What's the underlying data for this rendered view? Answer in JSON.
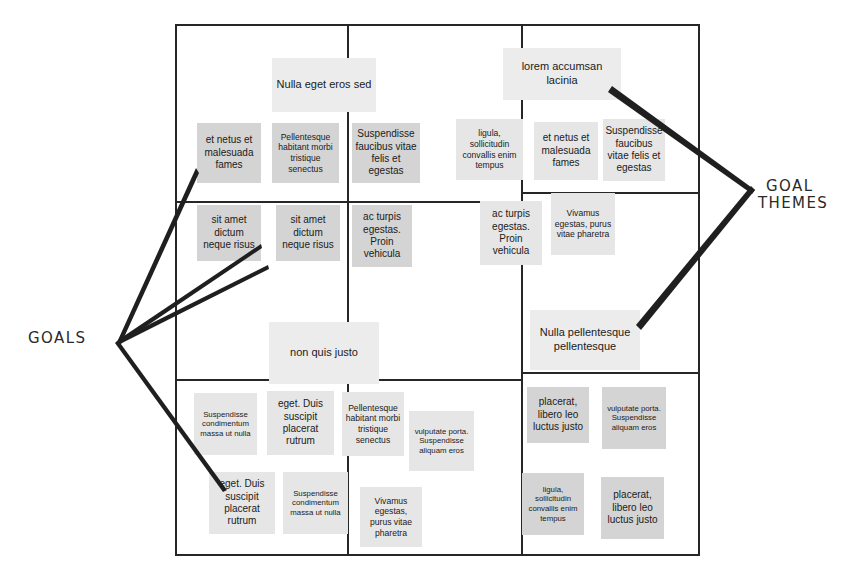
{
  "diagram": {
    "frame": {
      "x": 175,
      "y": 24,
      "width": 525,
      "height": 532
    },
    "colors": {
      "frame_line": "#262626",
      "header_note": "#ececec",
      "item_note_dark": "#d4d4d4",
      "item_note_light": "#e6e6e6",
      "text": "#1b1b1b",
      "annotation": "#2a2a2a"
    }
  },
  "annotations": [
    {
      "id": "goals",
      "label_line1": "GOALS",
      "label_line2": "",
      "x": 28,
      "y": 330
    },
    {
      "id": "goal-themes",
      "label_line1": "GOAL",
      "label_line2": "THEMES",
      "x": 766,
      "y": 178
    }
  ],
  "quadrants": {
    "top_left": {
      "header": {
        "text": "Nulla eget eros sed",
        "x": 272,
        "y": 58,
        "w": 104,
        "h": 54,
        "size": "fs-11"
      },
      "items": [
        {
          "text": "et netus et malesuada fames",
          "x": 197,
          "y": 123,
          "w": 64,
          "h": 60,
          "size": "fs-10",
          "tone": "item-dark"
        },
        {
          "text": "Pellentesque habitant morbi tristique senectus",
          "x": 272,
          "y": 123,
          "w": 67,
          "h": 60,
          "size": "fs-9",
          "tone": "item-dark"
        },
        {
          "text": "Suspendisse faucibus vitae felis et egestas",
          "x": 352,
          "y": 123,
          "w": 68,
          "h": 60,
          "size": "fs-10",
          "tone": "item-dark"
        },
        {
          "text": "sit amet dictum neque risus",
          "x": 197,
          "y": 205,
          "w": 64,
          "h": 56,
          "size": "fs-10",
          "tone": "item-dark"
        },
        {
          "text": "sit amet dictum neque risus",
          "x": 276,
          "y": 205,
          "w": 64,
          "h": 56,
          "size": "fs-10",
          "tone": "item-dark"
        },
        {
          "text": "ac turpis egestas. Proin vehicula",
          "x": 352,
          "y": 205,
          "w": 60,
          "h": 62,
          "size": "fs-10",
          "tone": "item-dark"
        }
      ]
    },
    "top_right": {
      "header": {
        "text": "lorem accumsan lacinia",
        "x": 503,
        "y": 48,
        "w": 118,
        "h": 52,
        "size": "fs-11"
      },
      "items": [
        {
          "text": "ligula, sollicitudin convallis enim tempus",
          "x": 456,
          "y": 119,
          "w": 67,
          "h": 61,
          "size": "fs-9",
          "tone": "item-light"
        },
        {
          "text": "et netus et malesuada fames",
          "x": 534,
          "y": 122,
          "w": 64,
          "h": 58,
          "size": "fs-10",
          "tone": "item-light"
        },
        {
          "text": "Suspendisse faucibus vitae felis et egestas",
          "x": 603,
          "y": 119,
          "w": 62,
          "h": 62,
          "size": "fs-10",
          "tone": "item-light"
        },
        {
          "text": "ac turpis egestas. Proin vehicula",
          "x": 480,
          "y": 201,
          "w": 62,
          "h": 64,
          "size": "fs-10",
          "tone": "item-light"
        },
        {
          "text": "Vivamus egestas, purus vitae pharetra",
          "x": 551,
          "y": 193,
          "w": 64,
          "h": 62,
          "size": "fs-9",
          "tone": "item-light"
        }
      ]
    },
    "bottom_left": {
      "header": {
        "text": "non quis justo",
        "x": 269,
        "y": 322,
        "w": 110,
        "h": 62,
        "size": "fs-11"
      },
      "items": [
        {
          "text": "Suspendisse condimentum massa ut nulla",
          "x": 194,
          "y": 393,
          "w": 63,
          "h": 62,
          "size": "fs-8",
          "tone": "item-light"
        },
        {
          "text": "eget. Duis suscipit placerat rutrum",
          "x": 267,
          "y": 391,
          "w": 67,
          "h": 64,
          "size": "fs-10",
          "tone": "item-light"
        },
        {
          "text": "Pellentesque habitant morbi tristique senectus",
          "x": 342,
          "y": 392,
          "w": 62,
          "h": 64,
          "size": "fs-9",
          "tone": "item-light"
        },
        {
          "text": "vulputate porta. Suspendisse aliquam eros",
          "x": 409,
          "y": 411,
          "w": 65,
          "h": 60,
          "size": "fs-8",
          "tone": "item-light"
        },
        {
          "text": "eget. Duis suscipit placerat rutrum",
          "x": 209,
          "y": 472,
          "w": 66,
          "h": 62,
          "size": "fs-10",
          "tone": "item-light"
        },
        {
          "text": "Suspendisse condimentum massa ut nulla",
          "x": 283,
          "y": 472,
          "w": 65,
          "h": 62,
          "size": "fs-8",
          "tone": "item-light"
        },
        {
          "text": "Vivamus egestas, purus vitae pharetra",
          "x": 360,
          "y": 487,
          "w": 62,
          "h": 60,
          "size": "fs-9",
          "tone": "item-light"
        }
      ]
    },
    "bottom_right": {
      "header": {
        "text": "Nulla pellentesque pellentesque",
        "x": 530,
        "y": 310,
        "w": 110,
        "h": 60,
        "size": "fs-11"
      },
      "items": [
        {
          "text": "placerat, libero leo luctus justo",
          "x": 527,
          "y": 387,
          "w": 62,
          "h": 56,
          "size": "fs-10",
          "tone": "item-dark"
        },
        {
          "text": "vulputate porta. Suspendisse aliquam eros",
          "x": 602,
          "y": 387,
          "w": 64,
          "h": 62,
          "size": "fs-8",
          "tone": "item-dark"
        },
        {
          "text": "ligula, sollicitudin convallis enim tempus",
          "x": 522,
          "y": 473,
          "w": 62,
          "h": 62,
          "size": "fs-8",
          "tone": "item-dark"
        },
        {
          "text": "placerat, libero leo luctus justo",
          "x": 601,
          "y": 477,
          "w": 63,
          "h": 62,
          "size": "fs-10",
          "tone": "item-dark"
        }
      ]
    }
  },
  "gridlines": [
    {
      "id": "v-center",
      "orient": "v",
      "x": 521,
      "y": 24,
      "len": 532
    },
    {
      "id": "v-left-inner",
      "orient": "v",
      "x": 347,
      "y": 24,
      "len": 532
    },
    {
      "id": "h-top-left",
      "orient": "h",
      "x": 175,
      "y": 201,
      "len": 346
    },
    {
      "id": "h-top-right",
      "orient": "h",
      "x": 521,
      "y": 192,
      "len": 179
    },
    {
      "id": "h-bottom-left",
      "orient": "h",
      "x": 175,
      "y": 379,
      "len": 346
    },
    {
      "id": "h-bottom-right",
      "orient": "h",
      "x": 521,
      "y": 372,
      "len": 179
    }
  ]
}
